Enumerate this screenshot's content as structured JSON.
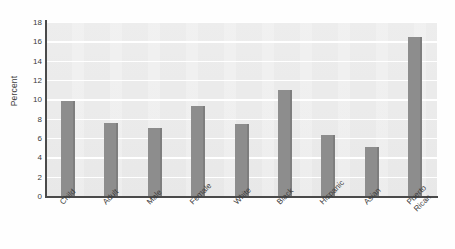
{
  "chart_data": {
    "type": "bar",
    "title": "",
    "subtitle": "",
    "xlabel": "",
    "ylabel": "Percent",
    "categories": [
      "Child",
      "Adult",
      "Male",
      "Female",
      "White",
      "Black",
      "Hispanic",
      "Asian",
      "Puerto\nRican"
    ],
    "values": [
      9.8,
      7.6,
      7.0,
      9.3,
      7.5,
      11.0,
      6.3,
      5.1,
      16.5
    ],
    "ylim": [
      0,
      18
    ],
    "ytick_labels": [
      "0",
      "2",
      "4",
      "6",
      "8",
      "10",
      "12",
      "14",
      "16",
      "18"
    ],
    "ytick_values": [
      0,
      2,
      4,
      6,
      8,
      10,
      12,
      14,
      16,
      18
    ],
    "grid": true,
    "grid_axis": "y",
    "legend": false,
    "legend_position": "none",
    "colors": {
      "bar": "#8d8d8d",
      "plot_background": "#ebebeb",
      "gridline": "#ffffff",
      "axis": "#4a4a4a",
      "text": "#3a3a3a",
      "figure_background": "#fefefe"
    }
  }
}
